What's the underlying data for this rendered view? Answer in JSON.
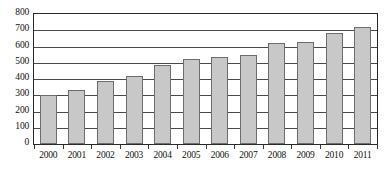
{
  "chart_data": {
    "type": "bar",
    "title": "",
    "subtitle": "",
    "xlabel": "",
    "ylabel": "",
    "categories": [
      "2000",
      "2001",
      "2002",
      "2003",
      "2004",
      "2005",
      "2006",
      "2007",
      "2008",
      "2009",
      "2010",
      "2011"
    ],
    "values": [
      300,
      330,
      385,
      420,
      485,
      525,
      535,
      548,
      620,
      628,
      682,
      722
    ],
    "series": [
      {
        "name": "",
        "values": [
          300,
          330,
          385,
          420,
          485,
          525,
          535,
          548,
          620,
          628,
          682,
          722
        ]
      }
    ],
    "ylim": [
      0,
      800
    ],
    "yticks": [
      0,
      100,
      200,
      300,
      400,
      500,
      600,
      700,
      800
    ],
    "ytick_labels": [
      "0",
      "100",
      "200",
      "300",
      "400",
      "500",
      "600",
      "700",
      "800"
    ],
    "xtick_labels": [
      "2000",
      "2001",
      "2002",
      "2003",
      "2004",
      "2005",
      "2006",
      "2007",
      "2008",
      "2009",
      "2010",
      "2011"
    ],
    "grid": true,
    "grid_axis": "y",
    "legend": false,
    "legend_position": "none",
    "annotations": [],
    "colors": {
      "bar_fill": "#c8c8c8",
      "bar_border": "#6d6d6d",
      "gridline": "#4a4a4a",
      "frame": "#2b2b2b",
      "text": "#111111",
      "background": "#ffffff"
    }
  }
}
